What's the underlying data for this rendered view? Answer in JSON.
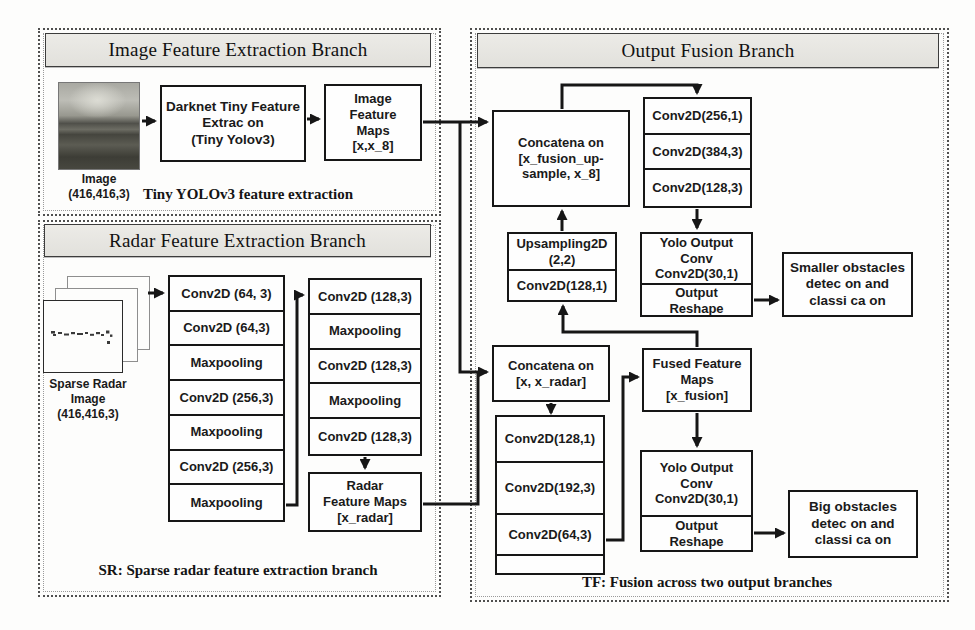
{
  "image_branch": {
    "header": "Image Feature Extraction Branch",
    "caption": "Tiny YOLOv3 feature extraction",
    "input": {
      "label": "Image",
      "shape": "(416,416,3)"
    },
    "darknet": {
      "l1": "Darknet Tiny Feature",
      "l2": "Extrac on",
      "l3": "(Tiny Yolov3)"
    },
    "maps": {
      "l1": "Image",
      "l2": "Feature",
      "l3": "Maps",
      "l4": "[x,x_8]"
    }
  },
  "radar_branch": {
    "header": "Radar Feature Extraction Branch",
    "caption": "SR: Sparse radar feature extraction branch",
    "input": {
      "l1": "Sparse Radar",
      "l2": "Image",
      "shape": "(416,416,3)"
    },
    "col1": [
      "Conv2D (64, 3)",
      "Conv2D (64,3)",
      "Maxpooling",
      "Conv2D (256,3)",
      "Maxpooling",
      "Conv2D (256,3)",
      "Maxpooling"
    ],
    "col2": [
      "Conv2D (128,3)",
      "Maxpooling",
      "Conv2D (128,3)",
      "Maxpooling",
      "Conv2D (128,3)"
    ],
    "maps": {
      "l1": "Radar",
      "l2": "Feature Maps",
      "l3": "[x_radar]"
    }
  },
  "fusion_branch": {
    "header": "Output Fusion Branch",
    "caption": "TF: Fusion across two output branches",
    "concat_up": {
      "l1": "Concatena on",
      "l2": "[x_fusion_up-",
      "l3": "sample, x_8]"
    },
    "top_stack": [
      "Conv2D(256,1)",
      "Conv2D(384,3)",
      "Conv2D(128,3)"
    ],
    "upsampling": {
      "l1": "Upsampling2D",
      "l2": "(2,2)",
      "l3": "Conv2D(128,1)"
    },
    "yolo_small": {
      "l1": "Yolo Output",
      "l2": "Conv",
      "l3": "Conv2D(30,1)",
      "l4": "Output",
      "l5": "Reshape"
    },
    "small_obstacles": {
      "l1": "Smaller obstacles",
      "l2": "detec on and",
      "l3": "classi ca on"
    },
    "concat_radar": {
      "l1": "Concatena on",
      "l2": "[x, x_radar]"
    },
    "fused_maps": {
      "l1": "Fused Feature",
      "l2": "Maps",
      "l3": "[x_fusion]"
    },
    "bottom_stack": [
      "Conv2D(128,1)",
      "Conv2D(192,3)",
      "Conv2D(64,3)"
    ],
    "yolo_big": {
      "l1": "Yolo Output",
      "l2": "Conv",
      "l3": "Conv2D(30,1)",
      "l4": "Output",
      "l5": "Reshape"
    },
    "big_obstacles": {
      "l1": "Big obstacles",
      "l2": "detec on and",
      "l3": "classi ca on"
    }
  },
  "colors": {
    "line": "#161616",
    "header_bg": "#e7e6e2",
    "box_border": "#161616"
  }
}
